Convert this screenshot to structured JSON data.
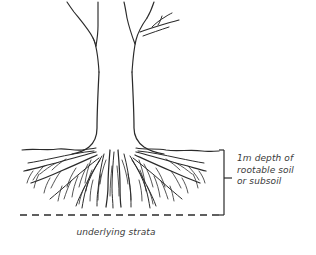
{
  "figure": {
    "background_color": "#ffffff",
    "ink_color": "#2b2b2b",
    "text_color": "#3a3a3a"
  },
  "labels": {
    "depth_callout": {
      "line1": "1m depth of",
      "line2": "rootable soil",
      "line3": "or subsoil"
    },
    "strata_caption": "underlying strata"
  },
  "annotations": {
    "soil_surface_name": "soil-surface-line",
    "strata_boundary_name": "underlying-strata-line",
    "bracket_name": "depth-bracket"
  }
}
